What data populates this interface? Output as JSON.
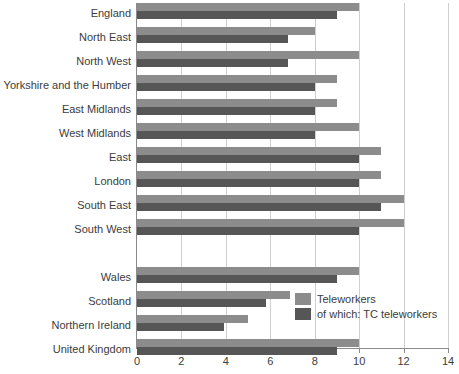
{
  "chart_data": {
    "type": "bar",
    "orientation": "horizontal",
    "title": "",
    "xlabel": "",
    "ylabel": "",
    "xlim": [
      0,
      14
    ],
    "xticks": [
      0,
      2,
      4,
      6,
      8,
      10,
      12,
      14
    ],
    "xtick_labels": [
      "0",
      "2",
      "4",
      "6",
      "8",
      "10",
      "12",
      "14"
    ],
    "grid": true,
    "grid_axis": "x",
    "legend_position": "inside-right-lower",
    "categories": [
      "England",
      "North East",
      "North West",
      "Yorkshire and the Humber",
      "East Midlands",
      "West Midlands",
      "East",
      "London",
      "South East",
      "South West",
      "",
      "Wales",
      "Scotland",
      "Northern Ireland",
      "United Kingdom"
    ],
    "series": [
      {
        "name": "Teleworkers",
        "color": "#8c8c8c",
        "values": [
          10.0,
          8.0,
          10.0,
          9.0,
          9.0,
          10.0,
          11.0,
          11.0,
          12.0,
          12.0,
          null,
          10.0,
          6.9,
          5.0,
          10.0
        ]
      },
      {
        "name": "of which: TC teleworkers",
        "color": "#565656",
        "values": [
          9.0,
          6.8,
          6.8,
          8.0,
          8.0,
          8.0,
          10.0,
          10.0,
          11.0,
          10.0,
          null,
          9.0,
          5.8,
          3.9,
          9.0
        ]
      }
    ]
  },
  "legend": {
    "items": [
      {
        "label": "Teleworkers",
        "color": "#8c8c8c"
      },
      {
        "label": "of which: TC teleworkers",
        "color": "#565656"
      }
    ]
  },
  "colors": {
    "light_bar": "#8c8c8c",
    "dark_bar": "#565656",
    "axis": "#8a8a8a",
    "gridline": "#cfcfcf",
    "text": "#3c3c3c",
    "background": "#ffffff"
  }
}
